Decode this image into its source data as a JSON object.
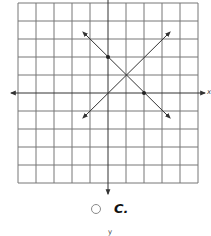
{
  "figure": {
    "type": "coordinate-grid",
    "grid": {
      "x_min": -5,
      "x_max": 5,
      "y_min": -5,
      "y_max": 5,
      "cells": 10
    },
    "axes": {
      "x_label": "x",
      "y_label": "y"
    },
    "lines": [
      {
        "name": "line-a",
        "equation": "y = -x + 2",
        "points": [
          [
            0,
            2
          ],
          [
            2,
            0
          ]
        ],
        "color": "#333333"
      },
      {
        "name": "line-b",
        "equation": "y = x",
        "points": [],
        "color": "#333333"
      }
    ],
    "intersection": [
      1,
      1
    ]
  },
  "choice": {
    "label": "C.",
    "selected": false
  },
  "footer": {
    "cut_label": "y"
  }
}
